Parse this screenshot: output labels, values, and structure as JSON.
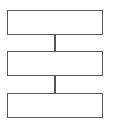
{
  "diagram": {
    "type": "flowchart",
    "direction": "top-to-bottom",
    "stroke_color": "#555555",
    "background": "#ffffff",
    "nodes": [
      {
        "id": "box-1",
        "label": ""
      },
      {
        "id": "box-2",
        "label": ""
      },
      {
        "id": "box-3",
        "label": ""
      }
    ],
    "edges": [
      {
        "from": "box-1",
        "to": "box-2"
      },
      {
        "from": "box-2",
        "to": "box-3"
      }
    ]
  }
}
